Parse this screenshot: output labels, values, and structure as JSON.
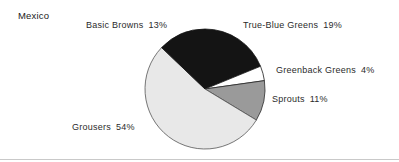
{
  "chart_data": {
    "type": "pie",
    "title": "Mexico",
    "xlabel": "",
    "ylabel": "",
    "legend_position": "none",
    "labels_outside": true,
    "grid": false,
    "start_angle_deg": 0,
    "direction": "clockwise",
    "categories": [
      "True-Blue Greens",
      "Greenback Greens",
      "Sprouts",
      "Grousers",
      "Basic Browns"
    ],
    "values": [
      19,
      4,
      11,
      54,
      13
    ],
    "value_suffix": "%",
    "slices": [
      {
        "name": "True-Blue Greens",
        "label": "True-Blue Greens",
        "value": 19,
        "value_text": "19%",
        "color": "#141414",
        "stroke": "#141414"
      },
      {
        "name": "Greenback Greens",
        "label": "Greenback Greens",
        "value": 4,
        "value_text": "4%",
        "color": "#ffffff",
        "stroke": "#1a1a1a"
      },
      {
        "name": "Sprouts",
        "label": "Sprouts",
        "value": 11,
        "value_text": "11%",
        "color": "#9a9a9a",
        "stroke": "#2b2b2b"
      },
      {
        "name": "Grousers",
        "label": "Grousers",
        "value": 54,
        "value_text": "54%",
        "color": "#e8e8e8",
        "stroke": "#555555"
      },
      {
        "name": "Basic Browns",
        "label": "Basic Browns",
        "value": 13,
        "value_text": "13%",
        "color": "#141414",
        "stroke": "#141414"
      }
    ]
  },
  "geometry": {
    "center_x": 205,
    "center_y": 89,
    "radius": 60
  }
}
